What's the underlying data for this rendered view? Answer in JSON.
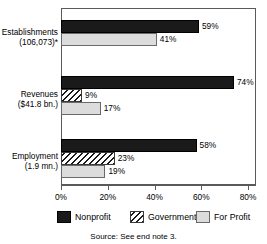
{
  "chart_data": {
    "type": "bar",
    "orientation": "horizontal",
    "title": "",
    "xlabel": "",
    "ylabel": "",
    "xlim": [
      0,
      80
    ],
    "grid": false,
    "legend_position": "bottom",
    "tick_labels": [
      "0%",
      "20%",
      "40%",
      "60%",
      "80%"
    ],
    "tick_values": [
      0,
      20,
      40,
      60,
      80
    ],
    "categories": [
      "Establishments (106,073)*",
      "Revenues ($41.8 bn.)",
      "Employment (1.9 mn.)"
    ],
    "series": [
      {
        "name": "Nonprofit",
        "values": [
          59,
          74,
          58
        ]
      },
      {
        "name": "Government",
        "values": [
          null,
          9,
          23
        ]
      },
      {
        "name": "For Profit",
        "values": [
          41,
          17,
          19
        ]
      }
    ],
    "groups": [
      {
        "label_line1": "Establishments",
        "label_line2": "(106,073)*",
        "bars": [
          {
            "series": "Nonprofit",
            "value": 59,
            "label": "59%"
          },
          {
            "series": "For Profit",
            "value": 41,
            "label": "41%"
          }
        ]
      },
      {
        "label_line1": "Revenues",
        "label_line2": "($41.8 bn.)",
        "bars": [
          {
            "series": "Nonprofit",
            "value": 74,
            "label": "74%"
          },
          {
            "series": "Government",
            "value": 9,
            "label": "9%"
          },
          {
            "series": "For Profit",
            "value": 17,
            "label": "17%"
          }
        ]
      },
      {
        "label_line1": "Employment",
        "label_line2": "(1.9 mn.)",
        "bars": [
          {
            "series": "Nonprofit",
            "value": 58,
            "label": "58%"
          },
          {
            "series": "Government",
            "value": 23,
            "label": "23%"
          },
          {
            "series": "For Profit",
            "value": 19,
            "label": "19%"
          }
        ]
      }
    ],
    "legend": [
      {
        "label": "Nonprofit",
        "pattern": "solid-black",
        "color": "#1a1a1a"
      },
      {
        "label": "Government",
        "pattern": "diagonal-hatch",
        "color": "#1a1a1a"
      },
      {
        "label": "For Profit",
        "pattern": "solid-light-gray",
        "color": "#dcdcdc"
      }
    ]
  },
  "source": {
    "text": "Source: See end note 3."
  }
}
